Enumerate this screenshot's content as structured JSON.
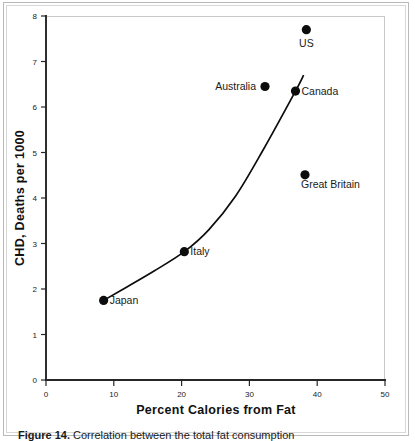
{
  "chart_data": {
    "type": "scatter",
    "title": "",
    "xlabel": "Percent Calories from Fat",
    "ylabel": "CHD, Deaths per 1000",
    "xlim": [
      0,
      50
    ],
    "ylim": [
      0,
      8
    ],
    "xticks": [
      0,
      10,
      20,
      30,
      40,
      50
    ],
    "yticks": [
      0,
      1,
      2,
      3,
      4,
      5,
      6,
      7,
      8
    ],
    "grid": false,
    "legend": "none",
    "points": [
      {
        "label": "Japan",
        "x": 8.5,
        "y": 1.75,
        "label_pos": "right"
      },
      {
        "label": "Italy",
        "x": 20.4,
        "y": 2.82,
        "label_pos": "right"
      },
      {
        "label": "Australia",
        "x": 32.3,
        "y": 6.45,
        "label_pos": "left"
      },
      {
        "label": "Canada",
        "x": 36.8,
        "y": 6.35,
        "label_pos": "right"
      },
      {
        "label": "Great Britain",
        "x": 38.2,
        "y": 4.51,
        "label_pos": "below-right"
      },
      {
        "label": "US",
        "x": 38.4,
        "y": 7.7,
        "label_pos": "below"
      }
    ],
    "fit_curve": {
      "description": "exponential trend line through Japan, Italy, Canada",
      "x": [
        8.5,
        12,
        16,
        20.4,
        24,
        28,
        32,
        36.8,
        38.0
      ],
      "y": [
        1.75,
        2.05,
        2.4,
        2.82,
        3.3,
        4.05,
        5.05,
        6.35,
        6.7
      ]
    }
  },
  "caption": {
    "number": "Figure 14.",
    "text": " Correlation between the total fat consumption"
  },
  "colors": {
    "marker": "#0d0d0d",
    "curve": "#0d0d0d",
    "axis": "#262626",
    "text": "#1a1a1a",
    "frame": "#b9b9b9",
    "background": "#ffffff"
  }
}
